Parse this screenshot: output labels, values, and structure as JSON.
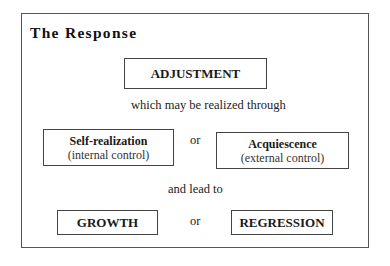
{
  "diagram": {
    "title": "The Response",
    "nodes": {
      "adjustment": "ADJUSTMENT",
      "self_realization": {
        "label": "Self-realization",
        "sublabel": "(internal control)"
      },
      "acquiescence": {
        "label": "Acquiescence",
        "sublabel": "(external control)"
      },
      "growth": "GROWTH",
      "regression": "REGRESSION"
    },
    "connectors": {
      "realized_through": "which may be realized through",
      "or_1": "or",
      "lead_to": "and lead to",
      "or_2": "or"
    }
  }
}
